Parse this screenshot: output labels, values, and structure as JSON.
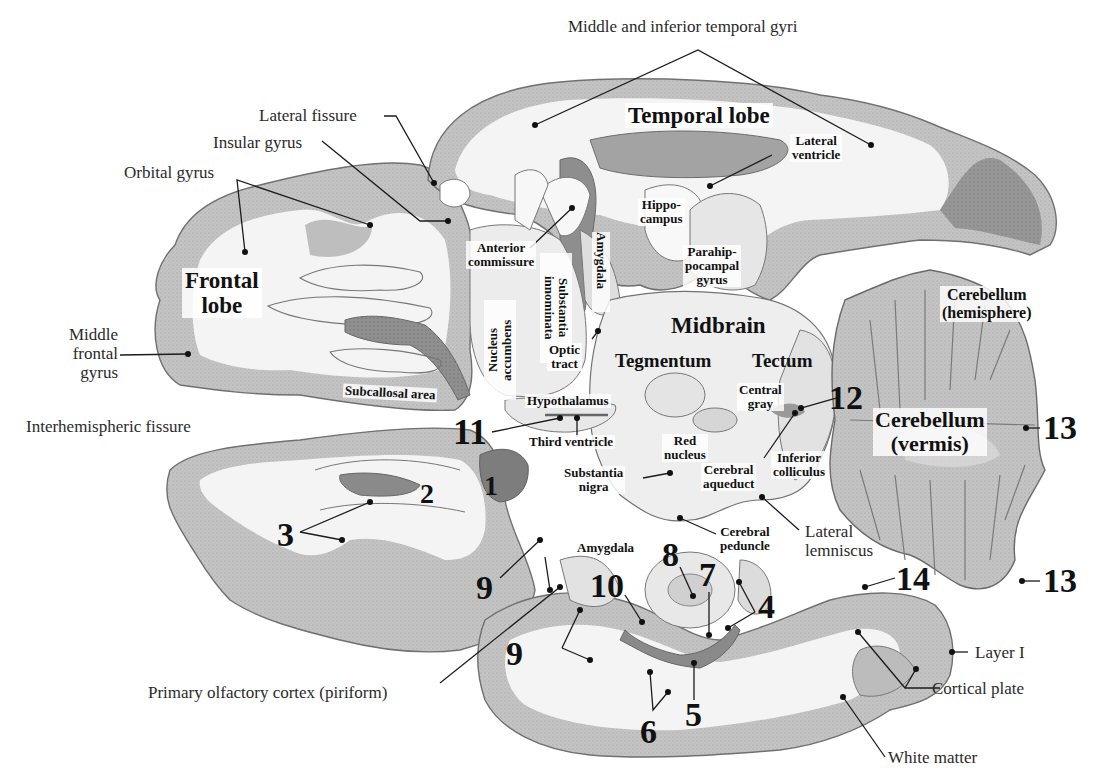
{
  "figure": {
    "type": "horizontal brain section (atlas illustration)",
    "colors": {
      "background": "#ffffff",
      "white_matter": "#f2f2f2",
      "cortex": "#bdbdbd",
      "dark_gray": "#8a8a8a",
      "outline": "#6f6f6f",
      "leader_line": "#1a1a1a"
    }
  },
  "regions": {
    "frontal_lobe": "Frontal\nlobe",
    "temporal_lobe": "Temporal lobe",
    "midbrain": "Midbrain",
    "tegmentum": "Tegmentum",
    "tectum": "Tectum",
    "cerebellum_hemisphere": "Cerebellum\n(hemisphere)",
    "cerebellum_vermis": "Cerebellum\n(vermis)"
  },
  "labels": {
    "middle_inferior_temporal_gyri": "Middle and inferior temporal gyri",
    "lateral_fissure": "Lateral fissure",
    "insular_gyrus": "Insular gyrus",
    "orbital_gyrus": "Orbital gyrus",
    "middle_frontal_gyrus": "Middle\nfrontal\ngyrus",
    "interhemispheric_fissure": "Interhemispheric fissure",
    "anterior_commissure": "Anterior\ncommissure",
    "substantia_innominata": "Substantia\ninnominata",
    "amygdala_upper": "Amygdala",
    "hippocampus": "Hippo-\ncampus",
    "parahippocampal_gyrus": "Parahip-\npocampal\ngyrus",
    "lateral_ventricle": "Lateral\nventricle",
    "nucleus_accumbens": "Nucleus\naccumbens",
    "optic_tract": "Optic\ntract",
    "subcallosal_area": "Subcallosal area",
    "hypothalamus": "Hypothalamus",
    "third_ventricle": "Third ventricle",
    "red_nucleus": "Red\nnucleus",
    "central_gray": "Central\ngray",
    "inferior_colliculus": "Inferior\ncolliculus",
    "cerebral_aqueduct": "Cerebral\naqueduct",
    "substantia_nigra": "Substantia\nnigra",
    "cerebral_peduncle": "Cerebral\npeduncle",
    "lateral_lemniscus": "Lateral\nlemniscus",
    "amygdala_lower": "Amygdala",
    "primary_olfactory_cortex": "Primary olfactory cortex (piriform)",
    "layer_i": "Layer I",
    "cortical_plate": "Cortical plate",
    "white_matter": "White matter"
  },
  "numbers": {
    "n1": "1",
    "n2": "2",
    "n3": "3",
    "n4": "4",
    "n5": "5",
    "n6": "6",
    "n7": "7",
    "n8": "8",
    "n9a": "9",
    "n9b": "9",
    "n10": "10",
    "n11": "11",
    "n12": "12",
    "n13a": "13",
    "n13b": "13",
    "n14": "14"
  }
}
